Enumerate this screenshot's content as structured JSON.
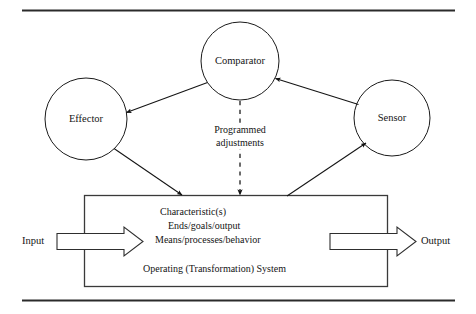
{
  "figure": {
    "stroke_color": "#1a1a1a",
    "rule_color": "#2b2b2b",
    "background": "#ffffff"
  },
  "nodes": {
    "comparator": {
      "label": "Comparator",
      "cx": 240,
      "cy": 61,
      "r": 39
    },
    "effector": {
      "label": "Effector",
      "cx": 86,
      "cy": 119,
      "r": 41
    },
    "sensor": {
      "label": "Sensor",
      "cx": 392,
      "cy": 118,
      "r": 38
    }
  },
  "flows": {
    "programmed_adjustments_line1": "Programmed",
    "programmed_adjustments_line2": "adjustments"
  },
  "io": {
    "input_label": "Input",
    "output_label": "Output"
  },
  "system_box": {
    "lines": [
      "Characteristic(s)",
      "Ends/goals/output",
      "Means/processes/behavior"
    ],
    "footer": "Operating (Transformation) System"
  }
}
